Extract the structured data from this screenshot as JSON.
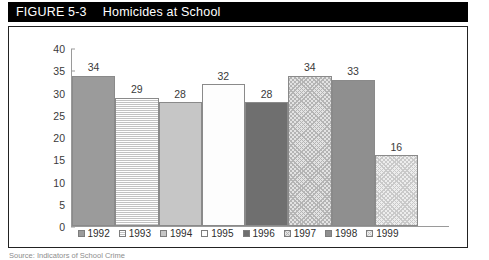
{
  "figure": {
    "label": "FIGURE 5-3",
    "title": "Homicides at School",
    "source_caption": "Source: Indicators of School Crime"
  },
  "colors": {
    "title_bar_bg": "#000000",
    "title_bar_fg": "#ffffff",
    "frame_border": "#222222",
    "axis": "#9a9a9a",
    "tick_text": "#3a3a3a"
  },
  "chart_data": {
    "type": "bar",
    "title": "Homicides at School",
    "xlabel": "",
    "ylabel": "",
    "ylim": [
      0,
      40
    ],
    "yticks": [
      0,
      5,
      10,
      15,
      20,
      25,
      30,
      35,
      40
    ],
    "grid": false,
    "legend_position": "bottom",
    "categories": [
      "1992",
      "1993",
      "1994",
      "1995",
      "1996",
      "1997",
      "1998",
      "1999"
    ],
    "values": [
      34,
      29,
      28,
      32,
      28,
      34,
      33,
      16
    ],
    "series": [
      {
        "name": "Homicides at School",
        "values": [
          34,
          29,
          28,
          32,
          28,
          34,
          33,
          16
        ]
      }
    ],
    "bars": [
      {
        "category": "1992",
        "value": 34,
        "pattern": "solid-dark-gray",
        "fill_class": "fill-solid-dark"
      },
      {
        "category": "1993",
        "value": 29,
        "pattern": "horizontal-stripe",
        "fill_class": "fill-hstripe"
      },
      {
        "category": "1994",
        "value": 28,
        "pattern": "solid-light-gray",
        "fill_class": "fill-solid-light"
      },
      {
        "category": "1995",
        "value": 32,
        "pattern": "solid-white",
        "fill_class": "fill-white"
      },
      {
        "category": "1996",
        "value": 28,
        "pattern": "solid-dark",
        "fill_class": "fill-solid-darker"
      },
      {
        "category": "1997",
        "value": 34,
        "pattern": "crosshatch",
        "fill_class": "fill-check"
      },
      {
        "category": "1998",
        "value": 33,
        "pattern": "solid-mid-gray",
        "fill_class": "fill-solid-mid"
      },
      {
        "category": "1999",
        "value": 16,
        "pattern": "crosshatch-light",
        "fill_class": "fill-check-light"
      }
    ],
    "legend": [
      {
        "label": "1992",
        "fill_class": "fill-solid-dark"
      },
      {
        "label": "1993",
        "fill_class": "fill-hstripe"
      },
      {
        "label": "1994",
        "fill_class": "fill-solid-light"
      },
      {
        "label": "1995",
        "fill_class": "fill-white"
      },
      {
        "label": "1996",
        "fill_class": "fill-solid-darker"
      },
      {
        "label": "1997",
        "fill_class": "fill-check"
      },
      {
        "label": "1998",
        "fill_class": "fill-solid-mid"
      },
      {
        "label": "1999",
        "fill_class": "fill-check-light"
      }
    ]
  }
}
